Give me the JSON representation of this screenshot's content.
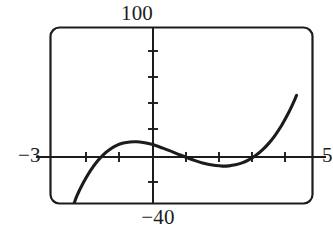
{
  "figure": {
    "name": "graphing-calculator-window",
    "background_color": "#ffffff",
    "ink_color": "#1c1c1c"
  },
  "labels": {
    "y_max": "100",
    "y_min": "−40",
    "x_min": "−3",
    "x_max": "5"
  },
  "chart_data": {
    "type": "line",
    "title": "",
    "xlabel": "",
    "ylabel": "",
    "xlim": [
      -3,
      5
    ],
    "ylim": [
      -40,
      100
    ],
    "grid": false,
    "legend": null,
    "axes": {
      "x_axis_at_y": 0,
      "y_axis_at_x": 0,
      "x_tick_step": 1,
      "y_tick_step": 20,
      "x_ticks": [
        -2,
        -1,
        1,
        2,
        3,
        4
      ],
      "y_ticks": [
        -20,
        20,
        40,
        60,
        80
      ]
    },
    "series": [
      {
        "name": "cubic-curve",
        "color": "#1c1c1c",
        "x": [
          -2.45,
          -2.3,
          -2.1,
          -1.9,
          -1.7,
          -1.5,
          -1.3,
          -1.1,
          -0.9,
          -0.7,
          -0.5,
          -0.3,
          -0.1,
          0.1,
          0.3,
          0.5,
          0.7,
          0.9,
          1.1,
          1.3,
          1.5,
          1.7,
          1.9,
          2.1,
          2.3,
          2.5,
          2.7,
          2.9,
          3.1,
          3.3,
          3.5,
          3.7,
          3.9,
          4.1,
          4.2,
          4.35
        ],
        "y": [
          -40,
          -29.5,
          -19.2,
          -10.6,
          -3.6,
          1.9,
          6,
          8.9,
          10.7,
          11.6,
          11.7,
          11.2,
          10.1,
          8.6,
          6.8,
          4.9,
          2.8,
          0.8,
          -1.2,
          -3,
          -4.6,
          -5.8,
          -6.6,
          -7,
          -6.8,
          -6,
          -4.5,
          -2.2,
          1,
          5.1,
          10.3,
          16.7,
          24.4,
          33.6,
          38.8,
          47.4
        ]
      }
    ],
    "features": {
      "local_maximum": {
        "x": -0.45,
        "y": 11.8
      },
      "local_minimum": {
        "x": 2.1,
        "y": -7
      },
      "x_intercepts": [
        -1.6,
        0.95,
        3.05
      ],
      "enters_window_at_bottom_x": -2.45,
      "exits_window_at_top_x": 4.35
    }
  }
}
